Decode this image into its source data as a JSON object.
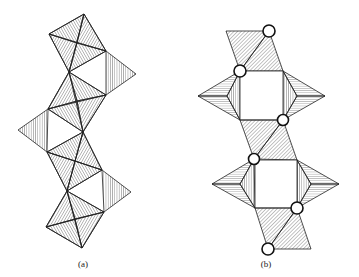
{
  "figure": {
    "panels": [
      {
        "id": "a",
        "label": "(a)",
        "description": "Chain of corner-sharing octahedra with triangular faces hatched"
      },
      {
        "id": "b",
        "label": "(b)",
        "description": "Chain of polyhedra with square openings and shared-vertex atoms shown as open circles"
      }
    ],
    "colors": {
      "line": "#222222",
      "hatch": "#444444",
      "background": "#ffffff",
      "circle_fill": "#ffffff"
    }
  }
}
